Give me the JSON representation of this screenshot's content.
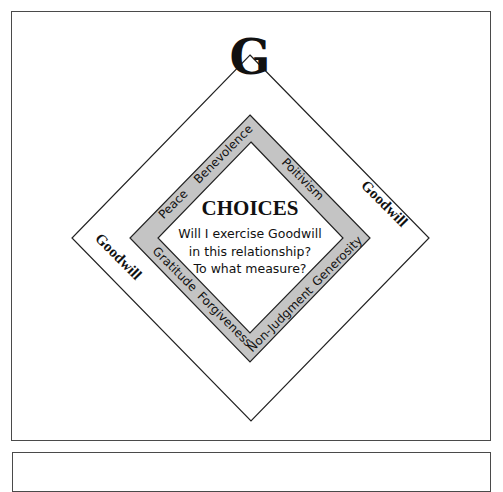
{
  "diagram": {
    "top_letter": "G",
    "center": {
      "title": "CHOICES",
      "lines": [
        "Will I exercise Goodwill",
        "in this relationship?",
        "To what measure?"
      ]
    },
    "band_words": {
      "upper_left": [
        "Peace",
        "Benevolence"
      ],
      "upper_right": [
        "Poitivism"
      ],
      "lower_left": [
        "Gratitude",
        "Forgiveness"
      ],
      "lower_right": [
        "Non-Judgment",
        "Generosity"
      ]
    },
    "outer_labels": {
      "left": "Goodwill",
      "right": "Goodwill"
    },
    "colors": {
      "band_fill": "#c4c4c4",
      "line": "#222222",
      "frame": "#4a4a4a",
      "background": "#ffffff"
    }
  }
}
